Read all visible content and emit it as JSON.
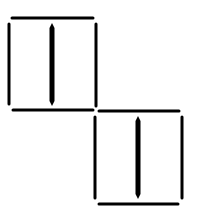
{
  "figure": {
    "width": 199,
    "height": 215,
    "background": "#ffffff",
    "stroke_color": "#000000"
  },
  "shapes": [
    {
      "name": "upper-left-square",
      "top": {
        "x1": 12,
        "y1": 18,
        "x2": 93,
        "y2": 18
      },
      "bottom": {
        "x1": 13,
        "y1": 110,
        "x2": 93,
        "y2": 110
      },
      "left": {
        "x1": 9,
        "y1": 24,
        "x2": 9,
        "y2": 104
      },
      "right": {
        "x1": 96,
        "y1": 24,
        "x2": 96,
        "y2": 106
      },
      "bar": {
        "x": 52,
        "y1": 23,
        "y2": 106,
        "width": 5
      }
    },
    {
      "name": "lower-right-square",
      "top": {
        "x1": 99,
        "y1": 111,
        "x2": 179,
        "y2": 111
      },
      "bottom": {
        "x1": 99,
        "y1": 204,
        "x2": 178,
        "y2": 204
      },
      "left": {
        "x1": 95,
        "y1": 117,
        "x2": 95,
        "y2": 198
      },
      "right": {
        "x1": 182,
        "y1": 117,
        "x2": 182,
        "y2": 198
      },
      "bar": {
        "x": 138,
        "y1": 116,
        "y2": 199,
        "width": 5
      }
    }
  ]
}
